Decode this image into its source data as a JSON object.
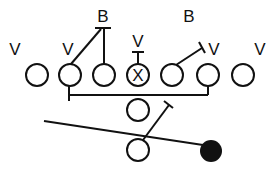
{
  "diagram": {
    "type": "football-play",
    "stroke_color": "#111111",
    "fill_color": "#111111",
    "labels": {
      "v1": "V",
      "v2": "V",
      "v3": "V",
      "v4": "V",
      "v5": "V",
      "b1": "B",
      "b2": "B"
    },
    "center_mark": "X",
    "players": [
      {
        "id": "p1",
        "x": 37,
        "y": 75
      },
      {
        "id": "p2",
        "x": 70,
        "y": 75
      },
      {
        "id": "p3",
        "x": 104,
        "y": 75
      },
      {
        "id": "p4-center",
        "x": 138,
        "y": 75,
        "mark": "X"
      },
      {
        "id": "p5",
        "x": 172,
        "y": 75
      },
      {
        "id": "p6",
        "x": 208,
        "y": 75
      },
      {
        "id": "p7",
        "x": 243,
        "y": 75
      },
      {
        "id": "p8",
        "x": 138,
        "y": 110
      },
      {
        "id": "p9",
        "x": 138,
        "y": 150
      },
      {
        "id": "ball-carrier",
        "x": 211,
        "y": 151,
        "filled": true
      }
    ]
  }
}
